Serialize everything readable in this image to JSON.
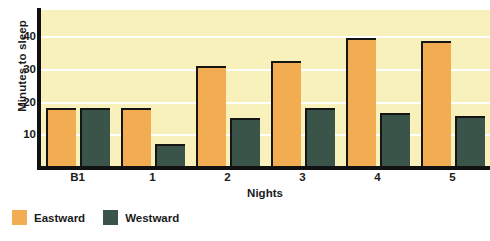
{
  "chart_data": {
    "type": "bar",
    "title": "",
    "subtitle": "",
    "xlabel": "Nights",
    "ylabel": "Minutes to sleep",
    "categories": [
      "B1",
      "1",
      "2",
      "3",
      "4",
      "5"
    ],
    "series": [
      {
        "name": "Eastward",
        "color": "#f2ad52",
        "values": [
          18,
          18,
          31,
          32.5,
          39.5,
          38.5
        ]
      },
      {
        "name": "Westward",
        "color": "#3b5449",
        "values": [
          18,
          7,
          15,
          18,
          16.5,
          15.5
        ]
      }
    ],
    "ylim": [
      0,
      48
    ],
    "yticks": [
      10,
      20,
      30,
      40
    ],
    "ytick_labels": [
      "10",
      "20",
      "30",
      "40"
    ],
    "gridlines": [
      10,
      20,
      30,
      40
    ],
    "grid": true,
    "grid_color": "#ffffff",
    "plot_background": "#f8f1bb",
    "axis_color": "#111111",
    "bar_edge_color": "#151515",
    "legend_position": "below-left",
    "legend": [
      "Eastward",
      "Westward"
    ]
  }
}
